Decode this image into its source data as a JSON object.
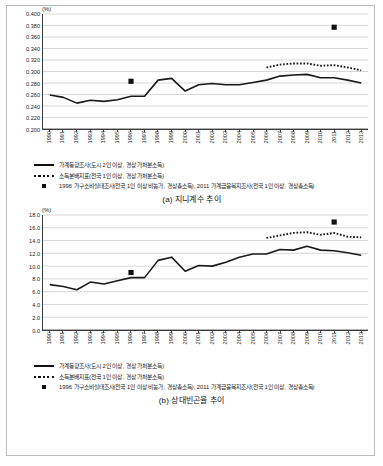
{
  "figures": [
    {
      "unit": "(%)",
      "caption": "(a) 지니계수 추이",
      "legend": [
        {
          "key": "solid-line",
          "label": "가계동향조사(도시 2인 이상, 경상 가처분소득)"
        },
        {
          "key": "dotted-line",
          "label": "소득분배지표(전국 1인 이상, 경상 가처분소득)"
        },
        {
          "key": "square-marker",
          "label": "1996 가구소비실태조사(전국 1인 이상 비농가, 경상총소득), 2011 가계금융복지조사(전국 1인 이상, 경상총소득)"
        }
      ],
      "chart_data": {
        "type": "line",
        "title": "(a) 지니계수 추이",
        "xlabel": "",
        "ylabel": "(%)",
        "ylim": [
          0.2,
          0.4
        ],
        "ytick_step": 0.02,
        "ytick_labels": [
          "0.400",
          "0.380",
          "0.360",
          "0.340",
          "0.320",
          "0.300",
          "0.280",
          "0.260",
          "0.240",
          "0.220",
          "0.200"
        ],
        "grid": true,
        "legend_position": "below",
        "x": [
          1990,
          1991,
          1992,
          1993,
          1994,
          1995,
          1996,
          1997,
          1998,
          1999,
          2000,
          2001,
          2002,
          2003,
          2004,
          2005,
          2006,
          2007,
          2008,
          2009,
          2010,
          2011,
          2012,
          2013
        ],
        "series": [
          {
            "name": "가계동향조사(도시 2인 이상, 경상 가처분소득)",
            "style": "solid",
            "values": [
              0.259,
              0.255,
              0.245,
              0.25,
              0.248,
              0.251,
              0.257,
              0.257,
              0.285,
              0.288,
              0.266,
              0.277,
              0.279,
              0.277,
              0.277,
              0.281,
              0.285,
              0.292,
              0.294,
              0.295,
              0.289,
              0.289,
              0.285,
              0.28
            ]
          },
          {
            "name": "소득분배지표(전국 1인 이상, 경상 가처분소득)",
            "style": "dotted",
            "values": [
              null,
              null,
              null,
              null,
              null,
              null,
              null,
              null,
              null,
              null,
              null,
              null,
              null,
              null,
              null,
              null,
              0.307,
              0.312,
              0.314,
              0.314,
              0.31,
              0.311,
              0.307,
              0.302
            ]
          },
          {
            "name": "1996 가구소비실태조사 / 2011 가계금융복지조사",
            "style": "square-marker",
            "points": [
              {
                "x": 1996,
                "y": 0.283
              },
              {
                "x": 2011,
                "y": 0.377
              }
            ]
          }
        ]
      }
    },
    {
      "unit": "(%)",
      "caption": "(b) 상대빈곤율 추이",
      "legend": [
        {
          "key": "solid-line",
          "label": "가계동향조사(도시 2인 이상, 경상 가처분소득)"
        },
        {
          "key": "dotted-line",
          "label": "소득분배지표(전국 1인 이상, 경상 가처분소득)"
        },
        {
          "key": "square-marker",
          "label": "1996 가구소비실태조사(전국 1인 이상 비농가, 경상총소득), 2011 가계금융복지조사(전국 1인 이상, 경상총소득)"
        }
      ],
      "chart_data": {
        "type": "line",
        "title": "(b) 상대빈곤율 추이",
        "xlabel": "",
        "ylabel": "(%)",
        "ylim": [
          0.0,
          18.0
        ],
        "ytick_step": 2.0,
        "ytick_labels": [
          "18.0",
          "16.0",
          "14.0",
          "12.0",
          "10.0",
          "8.0",
          "6.0",
          "4.0",
          "2.0",
          "0.0"
        ],
        "grid": true,
        "legend_position": "below",
        "x": [
          1990,
          1991,
          1992,
          1993,
          1994,
          1995,
          1996,
          1997,
          1998,
          1999,
          2000,
          2001,
          2002,
          2003,
          2004,
          2005,
          2006,
          2007,
          2008,
          2009,
          2010,
          2011,
          2012,
          2013
        ],
        "series": [
          {
            "name": "가계동향조사(도시 2인 이상, 경상 가처분소득)",
            "style": "solid",
            "values": [
              7.1,
              6.8,
              6.3,
              7.5,
              7.2,
              7.7,
              8.2,
              8.2,
              10.9,
              11.4,
              9.2,
              10.1,
              10.0,
              10.6,
              11.4,
              11.9,
              11.9,
              12.6,
              12.5,
              13.1,
              12.5,
              12.4,
              12.1,
              11.7
            ]
          },
          {
            "name": "소득분배지표(전국 1인 이상, 경상 가처분소득)",
            "style": "dotted",
            "values": [
              null,
              null,
              null,
              null,
              null,
              null,
              null,
              null,
              null,
              null,
              null,
              null,
              null,
              null,
              null,
              null,
              14.4,
              14.8,
              15.2,
              15.3,
              14.9,
              15.2,
              14.6,
              14.5
            ]
          },
          {
            "name": "1996 가구소비실태조사 / 2011 가계금융복지조사",
            "style": "square-marker",
            "points": [
              {
                "x": 1996,
                "y": 9.0
              },
              {
                "x": 2011,
                "y": 16.9
              }
            ]
          }
        ]
      }
    }
  ]
}
